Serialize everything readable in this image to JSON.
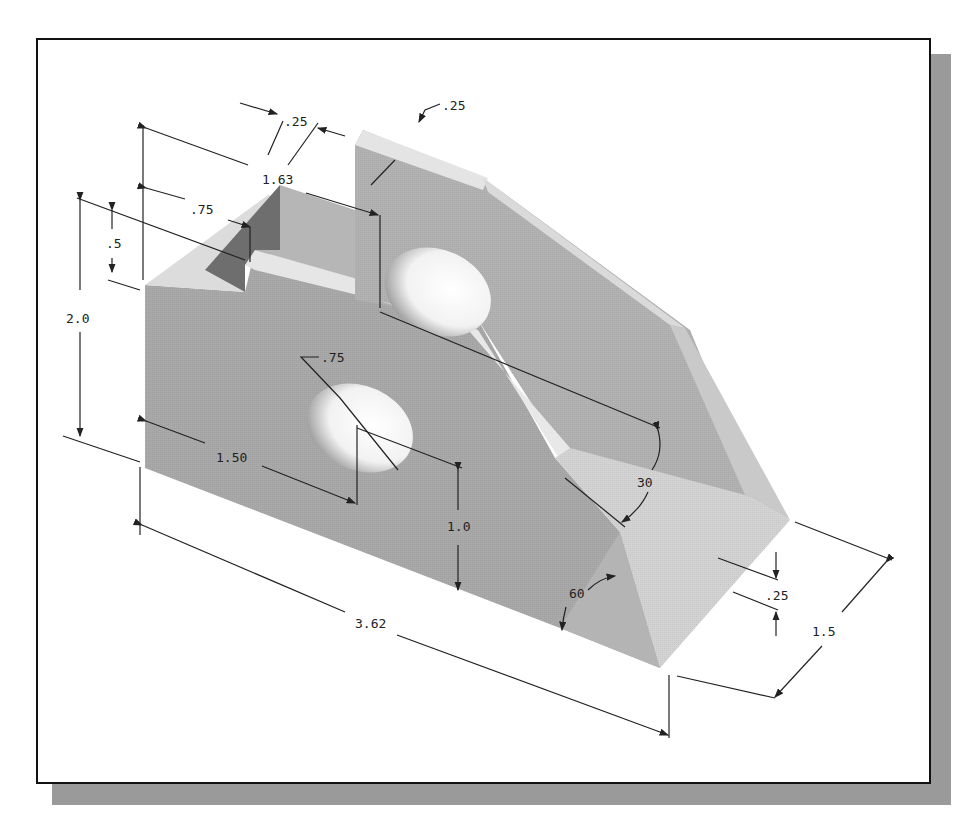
{
  "figure": {
    "colors": {
      "frame": "#111111",
      "shadow": "#9a9a9a",
      "face_dark": "#a9a9a9",
      "face_mid": "#c4c4c4",
      "face_light": "#e2e2e2",
      "slot_dark": "#6e6e6e",
      "dim_line": "#222222"
    },
    "dimensions": {
      "slot_width_top": ".25",
      "rib_thickness": ".25",
      "slot_depth_length": "1.63",
      "slot_offset": ".75",
      "slot_height": ".5",
      "overall_height": "2.0",
      "hole_diameter": ".75",
      "hole_x": "1.50",
      "hole_y": "1.0",
      "angle_upper": "30",
      "angle_lower": "60",
      "overall_length": "3.62",
      "overall_width": "1.5",
      "base_step": ".25"
    }
  }
}
